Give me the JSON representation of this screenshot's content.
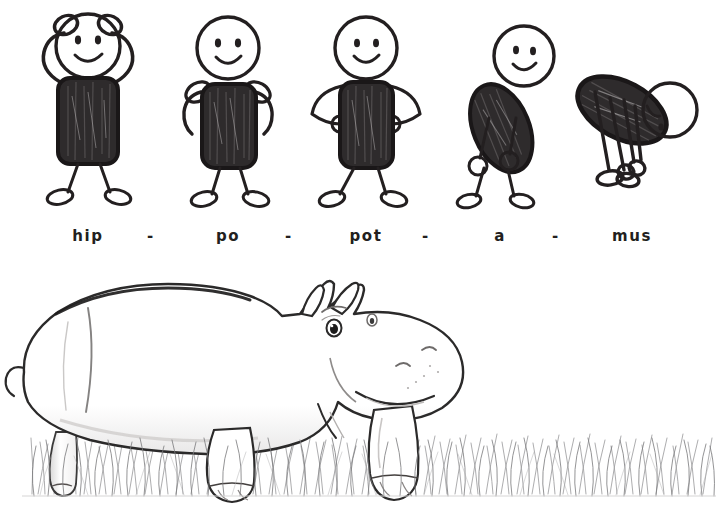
{
  "page": {
    "background_color": "#ffffff",
    "ink_color": "#231f20",
    "width": 728,
    "height": 522
  },
  "word": {
    "full": "hippopotamus",
    "syllable_count": 5
  },
  "syllables": [
    {
      "text": "hip",
      "pose": "hands-on-head",
      "x": 25
    },
    {
      "text": "po",
      "pose": "arms-at-shoulders",
      "x": 165
    },
    {
      "text": "pot",
      "pose": "hands-on-hips",
      "x": 305
    },
    {
      "text": "a",
      "pose": "bending-forward",
      "x": 442
    },
    {
      "text": "mus",
      "pose": "touching-toes",
      "x": 570
    }
  ],
  "separators": [
    {
      "text": "-",
      "x": 130
    },
    {
      "text": "-",
      "x": 268
    },
    {
      "text": "-",
      "x": 405
    },
    {
      "text": "-",
      "x": 535
    }
  ],
  "illustration": {
    "subject": "hippopotamus",
    "style": "pencil line art",
    "facing": "right",
    "ground": "grass",
    "features": [
      "ears",
      "eye",
      "eyebrow",
      "nostrils",
      "smiling-snout",
      "four-legs",
      "tail"
    ]
  }
}
